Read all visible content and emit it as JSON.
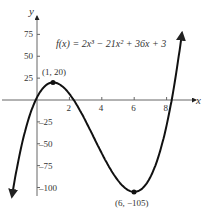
{
  "chart_data": {
    "type": "line",
    "title": "f(x) = 2x³ − 21x² + 36x + 3",
    "function": "2x^3 - 21x^2 + 36x + 3",
    "xlabel": "x",
    "ylabel": "y",
    "x_ticks": [
      "2",
      "4",
      "6",
      "8"
    ],
    "y_ticks": [
      "75",
      "50",
      "25",
      "−25",
      "−50",
      "−75",
      "−100"
    ],
    "xlim": [
      -2,
      9
    ],
    "ylim": [
      -115,
      95
    ],
    "grid": false,
    "annotations": [
      {
        "label": "(1, 20)",
        "x": 1,
        "y": 20,
        "kind": "local maximum"
      },
      {
        "label": "(6, −105)",
        "x": 6,
        "y": -105,
        "kind": "local minimum"
      }
    ],
    "series": [
      {
        "name": "f(x)",
        "x": [
          -1.5,
          -1,
          -0.5,
          0,
          0.5,
          1,
          1.5,
          2,
          3,
          4,
          5,
          6,
          7,
          8,
          8.5,
          8.9
        ],
        "values": [
          -93.0,
          -56,
          -22.5,
          3,
          15.5,
          20,
          18,
          11,
          -24,
          -61,
          -92,
          -105,
          -88,
          -29,
          12.5,
          60
        ]
      }
    ]
  },
  "labels": {
    "equation": "f(x) = 2x³ − 21x² + 36x + 3",
    "max_point": "(1, 20)",
    "min_point": "(6, −105)",
    "x_axis": "x",
    "y_axis": "y"
  }
}
